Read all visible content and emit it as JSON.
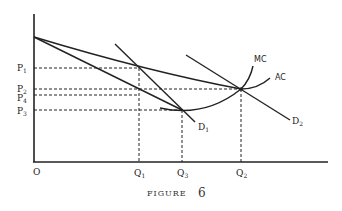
{
  "figure": {
    "caption_word": "FIGURE",
    "caption_number": "6",
    "origin_label": "O",
    "price_labels": [
      {
        "id": "P1",
        "base": "P",
        "sub": "1"
      },
      {
        "id": "P2",
        "base": "P",
        "sub": "2"
      },
      {
        "id": "P4",
        "base": "P",
        "sub": "4"
      },
      {
        "id": "P3",
        "base": "P",
        "sub": "3"
      }
    ],
    "quantity_labels": [
      {
        "id": "Q1",
        "base": "Q",
        "sub": "1"
      },
      {
        "id": "Q3",
        "base": "Q",
        "sub": "3"
      },
      {
        "id": "Q2",
        "base": "Q",
        "sub": "2"
      }
    ],
    "curve_labels": {
      "mc": "MC",
      "ac": "AC",
      "d1": {
        "base": "D",
        "sub": "1"
      },
      "d2": {
        "base": "D",
        "sub": "2"
      }
    },
    "line_color": "#222222"
  }
}
